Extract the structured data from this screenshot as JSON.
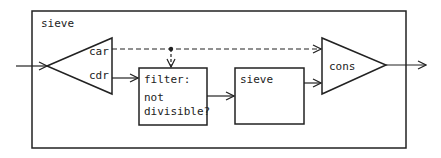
{
  "diagram": {
    "outer_label": "sieve",
    "splitter": {
      "out_top": "car",
      "out_bottom": "cdr"
    },
    "filter": {
      "line1": "filter:",
      "line2": "not",
      "line3": "divisible?"
    },
    "inner_sieve": "sieve",
    "combiner": "cons",
    "colors": {
      "stroke": "#222222",
      "background": "#ffffff"
    }
  }
}
